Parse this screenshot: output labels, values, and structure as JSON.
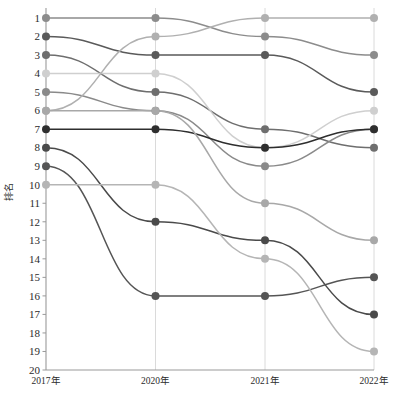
{
  "chart_data": {
    "type": "line",
    "subtype": "bump-rank-chart",
    "title": "",
    "xlabel": "",
    "ylabel": "排名",
    "x": [
      "2017年",
      "2020年",
      "2021年",
      "2022年"
    ],
    "categories": [
      "2017年",
      "2020年",
      "2021年",
      "2022年"
    ],
    "ylim": [
      1,
      20
    ],
    "y_inverted": true,
    "yticks": [
      1,
      2,
      3,
      4,
      5,
      6,
      7,
      8,
      9,
      10,
      11,
      12,
      13,
      14,
      15,
      16,
      17,
      18,
      19,
      20
    ],
    "yticklabels": [
      "1",
      "2",
      "3",
      "4",
      "5",
      "6",
      "7",
      "8",
      "9",
      "10",
      "11",
      "12",
      "13",
      "14",
      "15",
      "16",
      "17",
      "18",
      "19",
      "20"
    ],
    "xticklabels": [
      "2017年",
      "2020年",
      "2021年",
      "2022年"
    ],
    "grid": "vertical-only",
    "legend": "none",
    "marker": "circle",
    "series": [
      {
        "name": "S1",
        "values": [
          1,
          1,
          2,
          3
        ],
        "color": "#8c8c8c"
      },
      {
        "name": "S2",
        "values": [
          2,
          3,
          3,
          5
        ],
        "color": "#5a5a5a"
      },
      {
        "name": "S3",
        "values": [
          3,
          5,
          7,
          8
        ],
        "color": "#6e6e6e"
      },
      {
        "name": "S4",
        "values": [
          4,
          4,
          8,
          6
        ],
        "color": "#cfcfcf"
      },
      {
        "name": "S5",
        "values": [
          5,
          6,
          9,
          7
        ],
        "color": "#8a8a8a"
      },
      {
        "name": "S6",
        "values": [
          6,
          2,
          1,
          1
        ],
        "color": "#b0b0b0"
      },
      {
        "name": "S7",
        "values": [
          7,
          7,
          8,
          7
        ],
        "color": "#2e2e2e"
      },
      {
        "name": "S8",
        "values": [
          8,
          12,
          13,
          17
        ],
        "color": "#4a4a4a"
      },
      {
        "name": "S9",
        "values": [
          9,
          16,
          16,
          15
        ],
        "color": "#555555"
      },
      {
        "name": "S10",
        "values": [
          10,
          10,
          14,
          19
        ],
        "color": "#b5b5b5"
      },
      {
        "name": "S11",
        "values": [
          6,
          6,
          11,
          13
        ],
        "color": "#a8a8a8"
      }
    ]
  },
  "axes": {
    "y_label": "排名",
    "axis_color": "#9a9a9a",
    "gridline_color": "#d6d6d6",
    "tick_label_color": "#2b2b2b"
  }
}
